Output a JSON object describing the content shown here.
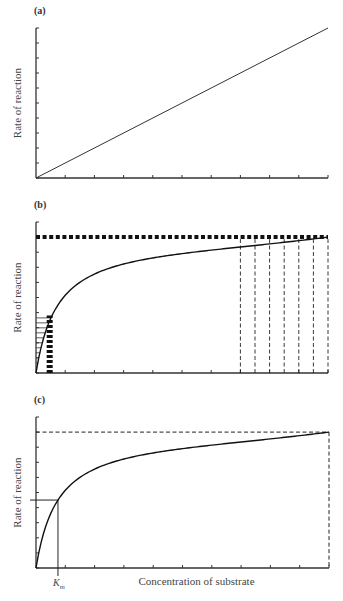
{
  "chart_data": [
    {
      "type": "line",
      "panel_label": "(a)",
      "title": "",
      "xlabel": "",
      "ylabel": "Rate of reaction",
      "xlim": [
        0,
        10
      ],
      "ylim": [
        0,
        10
      ],
      "x_ticks": [
        0,
        1,
        2,
        3,
        4,
        5,
        6,
        7,
        8,
        9,
        10
      ],
      "y_ticks": [
        0,
        1,
        2,
        3,
        4,
        5,
        6,
        7,
        8,
        9,
        10
      ],
      "tick_labels_shown": false,
      "series": [
        {
          "name": "linear",
          "x": [
            0,
            10
          ],
          "y": [
            0,
            10
          ]
        }
      ]
    },
    {
      "type": "line",
      "panel_label": "(b)",
      "title": "",
      "xlabel": "",
      "ylabel": "Rate of reaction",
      "xlim": [
        0,
        10
      ],
      "ylim": [
        0,
        10
      ],
      "x_ticks": [
        0,
        1,
        2,
        3,
        4,
        5,
        6,
        7,
        8,
        9,
        10
      ],
      "y_ticks": [
        0,
        1,
        2,
        3,
        4,
        5,
        6,
        7,
        8,
        9,
        10
      ],
      "tick_labels_shown": false,
      "model": "michaelis-menten",
      "vmax": 9,
      "km": 0.75,
      "series": [
        {
          "name": "rate curve",
          "x": [
            0,
            0.25,
            0.5,
            0.75,
            1,
            1.5,
            2,
            3,
            4,
            5,
            6,
            7,
            8,
            9,
            10
          ],
          "y": [
            0,
            2.25,
            3.6,
            4.5,
            5.14,
            6.0,
            6.55,
            7.2,
            7.58,
            7.83,
            8.0,
            8.13,
            8.24,
            8.32,
            8.37
          ]
        }
      ],
      "annotations": {
        "vmax_line": {
          "y": 9,
          "style": "thick-dashed"
        },
        "horizontal_hatch_region": {
          "x_max": 0.58,
          "y_max": 3.8
        },
        "thick_dashed_verticals": {
          "x": 0.4
        },
        "vertical_dashed_lines_x": [
          7,
          7.5,
          8,
          8.5,
          9,
          9.5,
          10
        ]
      }
    },
    {
      "type": "line",
      "panel_label": "(c)",
      "title": "",
      "xlabel": "Concentration of substrate",
      "ylabel": "Rate of reaction",
      "xlim": [
        0,
        10
      ],
      "ylim": [
        0,
        10
      ],
      "x_ticks": [
        0,
        1,
        2,
        3,
        4,
        5,
        6,
        7,
        8,
        9,
        10
      ],
      "y_ticks": [
        0,
        1,
        2,
        3,
        4,
        5,
        6,
        7,
        8,
        9,
        10
      ],
      "tick_labels_shown": false,
      "model": "michaelis-menten",
      "vmax": 9,
      "km": 0.75,
      "series": [
        {
          "name": "rate curve",
          "x": [
            0,
            0.25,
            0.5,
            0.75,
            1,
            1.5,
            2,
            3,
            4,
            5,
            6,
            7,
            8,
            9,
            10
          ],
          "y": [
            0,
            2.25,
            3.6,
            4.5,
            5.14,
            6.0,
            6.55,
            7.2,
            7.58,
            7.83,
            8.0,
            8.13,
            8.24,
            8.32,
            8.37
          ]
        }
      ],
      "annotations": {
        "vmax_line": {
          "y": 9,
          "style": "dashed"
        },
        "right_dashed_vertical": {
          "x": 10
        },
        "half_vmax_line": {
          "y": 4.5
        },
        "km_marker": {
          "x": 0.75,
          "label": "K",
          "subscript": "m"
        }
      }
    }
  ]
}
